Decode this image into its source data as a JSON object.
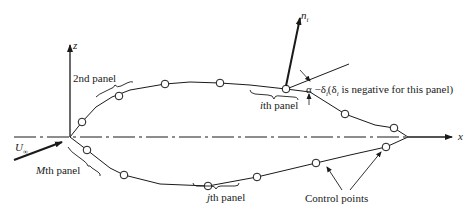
{
  "diagram": {
    "axes": {
      "z_label": "z",
      "x_label": "x"
    },
    "freestream": {
      "label_main": "U",
      "label_sub": "∞"
    },
    "normal": {
      "label_main": "n",
      "label_sub": "i"
    },
    "labels": {
      "second_panel": "2nd panel",
      "mth_panel_var": "M",
      "mth_panel_rest": "th panel",
      "ith_panel_var": "i",
      "ith_panel_rest": "th panel",
      "jth_panel_var": "j",
      "jth_panel_rest": "th panel",
      "angle": "α  −δ",
      "angle_sub": "i",
      "angle_note_open": "(δ",
      "angle_note_sub": "i",
      "angle_note_rest": " is negative for this panel)",
      "control_points": "Control points"
    },
    "colors": {
      "line": "#1a1a1a",
      "background": "#ffffff"
    }
  }
}
